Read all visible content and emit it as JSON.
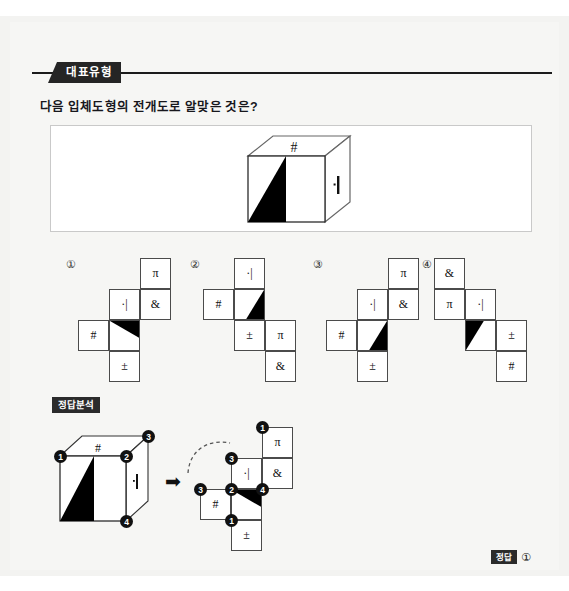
{
  "header": {
    "tag_label": "대표유형"
  },
  "question": {
    "text": "다음 입체도형의 전개도로 알맞은 것은?"
  },
  "figure": {
    "top_symbol": "#",
    "right_symbol": "·|",
    "front_shading": "black-triangle"
  },
  "symbols": {
    "pi": "π",
    "amp": "&",
    "hash": "#",
    "bar": "·|",
    "pm": "±"
  },
  "options": [
    {
      "marker": "①",
      "cells": [
        {
          "label": "π",
          "col": 1,
          "row": 0
        },
        {
          "label": "·|",
          "col": 0,
          "row": 1
        },
        {
          "label": "&",
          "col": 1,
          "row": 1
        },
        {
          "label": "#",
          "col": -1,
          "row": 2
        },
        {
          "label": "",
          "col": 0,
          "row": 2,
          "triangle": "top-right-fill"
        },
        {
          "label": "±",
          "col": 0,
          "row": 3
        }
      ]
    },
    {
      "marker": "②",
      "cells": [
        {
          "label": "·|",
          "col": 0,
          "row": 0
        },
        {
          "label": "#",
          "col": -1,
          "row": 1
        },
        {
          "label": "",
          "col": 0,
          "row": 1,
          "triangle": "right-lean"
        },
        {
          "label": "±",
          "col": 0,
          "row": 2
        },
        {
          "label": "π",
          "col": 1,
          "row": 2
        },
        {
          "label": "&",
          "col": 1,
          "row": 3
        }
      ]
    },
    {
      "marker": "③",
      "cells": [
        {
          "label": "π",
          "col": 1,
          "row": 0
        },
        {
          "label": "·|",
          "col": 0,
          "row": 1
        },
        {
          "label": "&",
          "col": 1,
          "row": 1
        },
        {
          "label": "#",
          "col": -1,
          "row": 2
        },
        {
          "label": "",
          "col": 0,
          "row": 2,
          "triangle": "right-lean"
        },
        {
          "label": "±",
          "col": 0,
          "row": 3
        }
      ]
    },
    {
      "marker": "④",
      "cells": [
        {
          "label": "&",
          "col": 0,
          "row": 0
        },
        {
          "label": "π",
          "col": 0,
          "row": 1
        },
        {
          "label": "·|",
          "col": 1,
          "row": 1
        },
        {
          "label": "",
          "col": 1,
          "row": 2,
          "triangle": "left-lean"
        },
        {
          "label": "±",
          "col": 2,
          "row": 2
        },
        {
          "label": "#",
          "col": 2,
          "row": 3
        }
      ]
    }
  ],
  "analysis": {
    "tag_label": "정답분석",
    "arrow": "➡",
    "cube": {
      "top_symbol": "#",
      "right_symbol": "·|",
      "vertices": [
        "1",
        "2",
        "3",
        "4"
      ]
    },
    "net": {
      "cells": [
        {
          "label": "π",
          "col": 1,
          "row": 0
        },
        {
          "label": "·|",
          "col": 0,
          "row": 1
        },
        {
          "label": "&",
          "col": 1,
          "row": 1
        },
        {
          "label": "#",
          "col": -1,
          "row": 2
        },
        {
          "label": "",
          "col": 0,
          "row": 2,
          "triangle": "top-right-fill"
        },
        {
          "label": "±",
          "col": 0,
          "row": 3
        }
      ],
      "vertices": [
        "1",
        "3",
        "3",
        "2",
        "4",
        "1"
      ]
    }
  },
  "answer": {
    "tag_label": "정답",
    "value": "①"
  }
}
